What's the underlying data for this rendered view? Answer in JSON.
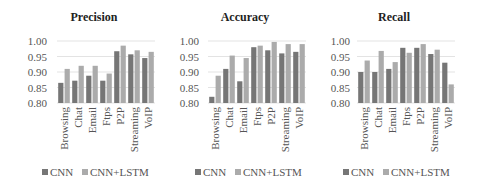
{
  "chart_data": [
    {
      "type": "bar",
      "title": "Precision",
      "xlabel": "",
      "ylabel": "",
      "categories": [
        "Browsing",
        "Chat",
        "Email",
        "Ftps",
        "P2P",
        "Streaming",
        "VoIP"
      ],
      "series": [
        {
          "name": "CNN",
          "values": [
            0.865,
            0.872,
            0.888,
            0.872,
            0.967,
            0.957,
            0.945
          ]
        },
        {
          "name": "CNN+LSTM",
          "values": [
            0.91,
            0.92,
            0.92,
            0.895,
            0.985,
            0.97,
            0.965
          ]
        }
      ],
      "ylim": [
        0.8,
        1.0
      ],
      "yticks": [
        "0.80",
        "0.85",
        "0.90",
        "0.95",
        "1.00"
      ],
      "grid": true,
      "legend": "bottom"
    },
    {
      "type": "bar",
      "title": "Accuracy",
      "xlabel": "",
      "ylabel": "",
      "categories": [
        "Browsing",
        "Chat",
        "Email",
        "Ftps",
        "P2P",
        "Streaming",
        "VoIP"
      ],
      "series": [
        {
          "name": "CNN",
          "values": [
            0.82,
            0.91,
            0.87,
            0.98,
            0.97,
            0.96,
            0.965
          ]
        },
        {
          "name": "CNN+LSTM",
          "values": [
            0.888,
            0.953,
            0.945,
            0.985,
            0.997,
            0.99,
            0.99
          ]
        }
      ],
      "ylim": [
        0.8,
        1.0
      ],
      "yticks": [
        "0.80",
        "0.85",
        "0.90",
        "0.95",
        "1.00"
      ],
      "grid": true,
      "legend": "bottom"
    },
    {
      "type": "bar",
      "title": "Recall",
      "xlabel": "",
      "ylabel": "",
      "categories": [
        "Browsing",
        "Chat",
        "Email",
        "Ftps",
        "P2P",
        "Streaming",
        "VoIP"
      ],
      "series": [
        {
          "name": "CNN",
          "values": [
            0.9,
            0.9,
            0.91,
            0.978,
            0.978,
            0.958,
            0.93
          ]
        },
        {
          "name": "CNN+LSTM",
          "values": [
            0.937,
            0.968,
            0.932,
            0.962,
            0.99,
            0.972,
            0.86
          ]
        }
      ],
      "ylim": [
        0.8,
        1.0
      ],
      "yticks": [
        "0.80",
        "0.85",
        "0.90",
        "0.95",
        "1.00"
      ],
      "grid": true,
      "legend": "bottom"
    }
  ],
  "colors": {
    "CNN": "#767676",
    "CNN+LSTM": "#ababab"
  }
}
